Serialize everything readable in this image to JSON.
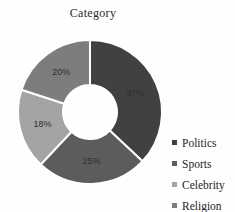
{
  "chart_data": {
    "type": "pie",
    "subtype": "donut",
    "title": "Category",
    "categories": [
      "Politics",
      "Sports",
      "Celebrity",
      "Religion"
    ],
    "values": [
      37,
      25,
      18,
      20
    ],
    "data_labels": [
      "37%",
      "25%",
      "18%",
      "20%"
    ],
    "colors": [
      "#414141",
      "#5c5c5c",
      "#a4a4a4",
      "#7d7d7d"
    ],
    "start_angle_deg": 0,
    "direction": "clockwise",
    "donut_hole_ratio": 0.38,
    "legend_position": "right",
    "slice_border_color": "#ffffff",
    "label_color": "#2e2e2e",
    "background": "#ffffff"
  },
  "legend": {
    "items": [
      {
        "label": "Politics",
        "color": "#414141"
      },
      {
        "label": "Sports",
        "color": "#5c5c5c"
      },
      {
        "label": "Celebrity",
        "color": "#a4a4a4"
      },
      {
        "label": "Religion",
        "color": "#7d7d7d"
      }
    ]
  },
  "geometry": {
    "center_x": 90,
    "center_y": 112,
    "outer_radius": 72,
    "inner_radius": 27,
    "label_radius": 49
  }
}
